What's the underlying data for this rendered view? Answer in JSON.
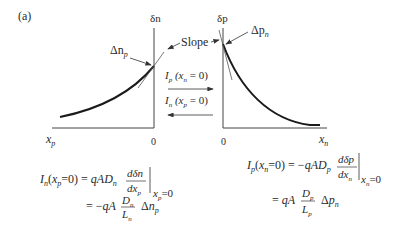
{
  "figure_label": "(a)",
  "left_plot": {
    "y_axis_label": "δn",
    "x_axis_label_main": "x",
    "x_axis_label_sub": "p",
    "origin_label": "0",
    "point_label_main": "Δn",
    "point_label_sub": "p"
  },
  "right_plot": {
    "y_axis_label": "δp",
    "x_axis_label_main": "x",
    "x_axis_label_sub": "n",
    "origin_label": "0",
    "point_label_main": "Δp",
    "point_label_sub": "n"
  },
  "slope_label": "Slope",
  "arrows": {
    "top": {
      "label": "I_p (x_n = 0)",
      "direction": "right"
    },
    "bottom": {
      "label": "I_n (x_p = 0)",
      "direction": "left"
    }
  },
  "equations": {
    "left": {
      "line1_lhs": "I_n(x_p = 0) = qAD_n dδn/dx_p |_{x_p=0}",
      "line2": "= −qA (D_n / L_n) Δn_p"
    },
    "right": {
      "line1_lhs": "I_p(x_n = 0) = −qAD_p dδp/dx_n |_{x_n=0}",
      "line2": "= qA (D_p / L_p) Δp_n"
    }
  }
}
